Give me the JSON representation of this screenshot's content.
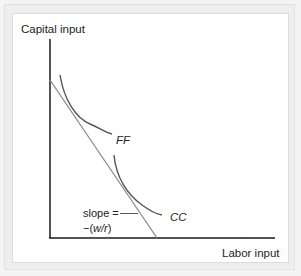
{
  "diagram": {
    "y_axis_label": "Capital input",
    "x_axis_label": "Labor input",
    "curves": [
      {
        "id": "FF",
        "label": "FF"
      },
      {
        "id": "CC",
        "label": "CC"
      }
    ],
    "budget_line": {
      "label_line1": "slope =",
      "label_line2_prefix": "−(",
      "label_line2_italic": "w/r",
      "label_line2_suffix": ")"
    },
    "colors": {
      "axis": "#1a1a1a",
      "curve": "#555555",
      "budget_line": "#8a8a8a",
      "frame": "#e6e6e6",
      "panel": "#ffffff"
    }
  }
}
